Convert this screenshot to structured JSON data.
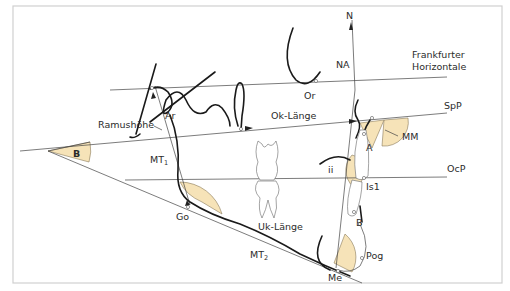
{
  "diagram": {
    "colors": {
      "angle_fill": "#f6e3b8",
      "line": "#444444",
      "contour": "#1a1a1a",
      "frame": "#d0d0d0"
    },
    "labels": {
      "N": "N",
      "NA": "NA",
      "Or": "Or",
      "frankfurt_1": "Frankfurter",
      "frankfurt_2": "Horizontale",
      "SpP": "SpP",
      "Ok_Laenge": "Ok-Länge",
      "MM": "MM",
      "A": "A",
      "Ramushoehe": "Ramushöhe",
      "Ar": "Ar",
      "B_angle": "B",
      "MT1": "MT",
      "MT1_sub": "1",
      "ii": "ii",
      "OcP": "OcP",
      "Is1": "Is1",
      "Go": "Go",
      "Uk_Laenge": "Uk-Länge",
      "B_point": "B",
      "MT2": "MT",
      "MT2_sub": "2",
      "Pog": "Pog",
      "Me": "Me"
    },
    "reference_lines": [
      "Frankfurter Horizontale",
      "SpP",
      "OcP",
      "MT1",
      "MT2",
      "N-line"
    ],
    "landmarks": [
      "N",
      "Or",
      "Ar",
      "A",
      "Is1",
      "B",
      "Pog",
      "Me",
      "Go"
    ],
    "angles": [
      "B",
      "MM",
      "ii",
      "Go",
      "Me"
    ]
  }
}
